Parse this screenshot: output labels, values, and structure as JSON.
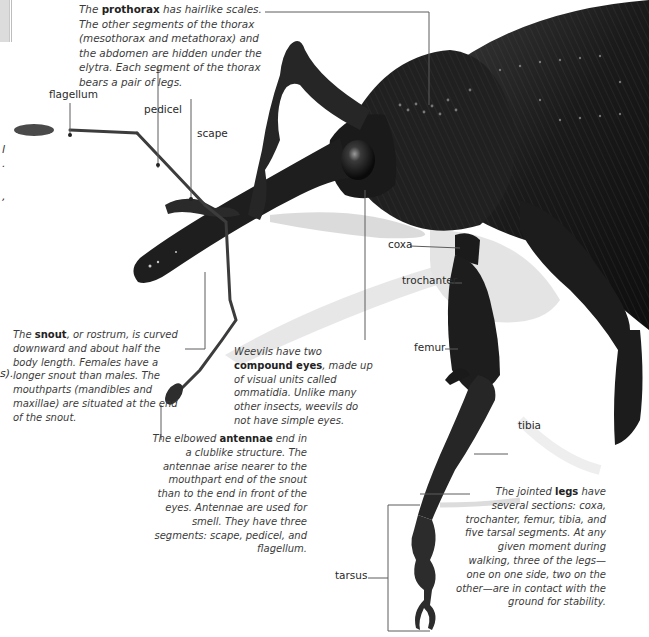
{
  "figure": {
    "line_color": "#555555",
    "body_color": "#1c1c1c"
  },
  "left_edge_fragments": [
    "l",
    ".",
    ",",
    "s)."
  ],
  "captions": {
    "prothorax": {
      "pre": "The ",
      "bold": "prothorax",
      "post": " has hairlike scales. The other segments of the thorax (mesothorax and metathorax) and the abdomen are hidden under the elytra. Each segment of the thorax bears a pair of legs."
    },
    "snout": {
      "pre": "The ",
      "bold": "snout",
      "post": ", or rostrum, is curved downward and about half the body length. Females have a longer snout than males. The mouthparts (mandibles and maxillae) are situated at the end of the snout."
    },
    "eyes": {
      "pre": "Weevils have two ",
      "bold": "compound eyes",
      "post": ", made up of visual units called ommatidia. Unlike many other insects, weevils do not have simple eyes."
    },
    "antennae": {
      "pre": "The elbowed ",
      "bold": "antennae",
      "post": " end in a clublike structure. The antennae arise nearer to the mouthpart end of the snout than to the end in front of the eyes. Antennae are used for smell. They have three segments: scape, pedicel, and flagellum."
    },
    "legs": {
      "pre": "The jointed ",
      "bold": "legs",
      "post": " have several sections: coxa, trochanter, femur, tibia, and five tarsal segments. At any given moment during walking, three of the legs—one on one side, two on the other—are in contact with the ground for stability."
    }
  },
  "labels": {
    "flagellum": "flagellum",
    "pedicel": "pedicel",
    "scape": "scape",
    "coxa": "coxa",
    "trochanter": "trochanter",
    "femur": "femur",
    "tibia": "tibia",
    "tarsus": "tarsus"
  }
}
